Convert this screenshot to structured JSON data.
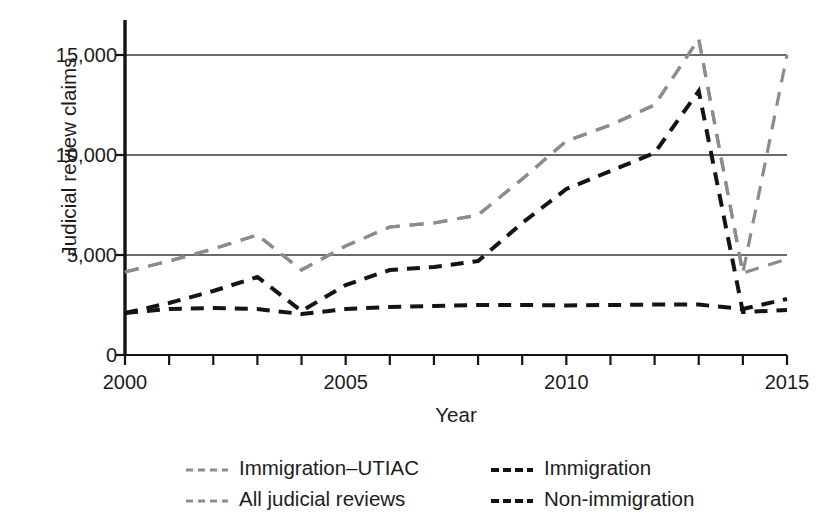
{
  "chart_data": {
    "type": "line",
    "title": "",
    "xlabel": "Year",
    "ylabel": "Judicial review claims",
    "xlim": [
      2000,
      2015
    ],
    "ylim": [
      0,
      16000
    ],
    "grid": "horizontal",
    "legend_position": "bottom",
    "x": [
      2000,
      2001,
      2002,
      2003,
      2004,
      2005,
      2006,
      2007,
      2008,
      2009,
      2010,
      2011,
      2012,
      2013,
      2014,
      2015
    ],
    "xticks": [
      2000,
      2001,
      2002,
      2003,
      2004,
      2005,
      2006,
      2007,
      2008,
      2009,
      2010,
      2011,
      2012,
      2013,
      2014,
      2015
    ],
    "xtick_labels": [
      "2000",
      "",
      "",
      "",
      "",
      "2005",
      "",
      "",
      "",
      "",
      "2010",
      "",
      "",
      "",
      "",
      "2015"
    ],
    "yticks": [
      0,
      5000,
      10000,
      15000
    ],
    "ytick_labels": [
      "0",
      "5,000",
      "10,000",
      "15,000"
    ],
    "series": [
      {
        "name": "All judicial reviews",
        "color": "#8c8c8c",
        "style": "dashed",
        "values": [
          4150,
          4700,
          5300,
          6000,
          4250,
          5450,
          6400,
          6600,
          7000,
          8800,
          10700,
          11500,
          12500,
          15800,
          4100,
          15000
        ]
      },
      {
        "name": "Immigration-UTIAC",
        "color": "#8c8c8c",
        "style": "dashed",
        "values": [
          4150,
          4700,
          5300,
          6000,
          4250,
          5450,
          6400,
          6600,
          7000,
          8800,
          10700,
          11500,
          12500,
          15800,
          4100,
          4800
        ]
      },
      {
        "name": "Immigration",
        "color": "#141414",
        "style": "dashed",
        "values": [
          2100,
          2600,
          3200,
          3900,
          2200,
          3500,
          4250,
          4400,
          4700,
          6600,
          8300,
          9200,
          10100,
          13200,
          2150,
          2250
        ]
      },
      {
        "name": "Non-immigration",
        "color": "#141414",
        "style": "dashed",
        "values": [
          2100,
          2300,
          2350,
          2300,
          2050,
          2300,
          2400,
          2450,
          2500,
          2500,
          2480,
          2500,
          2520,
          2520,
          2300,
          2800
        ]
      }
    ]
  },
  "legend": {
    "entries": [
      {
        "label": "Immigration–UTIAC",
        "color": "#8c8c8c"
      },
      {
        "label": "All judicial reviews",
        "color": "#8c8c8c"
      },
      {
        "label": "Immigration",
        "color": "#141414"
      },
      {
        "label": "Non-immigration",
        "color": "#141414"
      }
    ]
  },
  "axes": {
    "axis_color": "#141414",
    "gridline_color": "#3a3a3a"
  }
}
